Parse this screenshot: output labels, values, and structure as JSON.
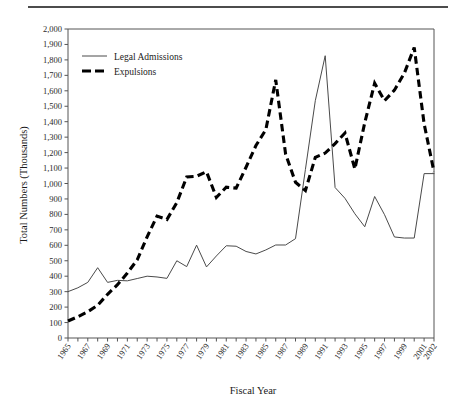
{
  "figure": {
    "rule_present": true
  },
  "chart_data": {
    "type": "line",
    "title": "",
    "xlabel": "Fiscal Year",
    "ylabel": "Total Numbers (Thousands)",
    "xlim": [
      1965,
      2002
    ],
    "ylim": [
      0,
      2000
    ],
    "ytick_step": 100,
    "grid": false,
    "legend_position": "upper-left-inside",
    "xtick_labels": [
      "1965",
      "1967",
      "1969",
      "1971",
      "1973",
      "1975",
      "1977",
      "1979",
      "1981",
      "1983",
      "1985",
      "1987",
      "1989",
      "1991",
      "1993",
      "1995",
      "1997",
      "1999",
      "2001",
      "2002"
    ],
    "ytick_labels": [
      "0",
      "100",
      "200",
      "300",
      "400",
      "500",
      "600",
      "700",
      "800",
      "900",
      "1,000",
      "1,100",
      "1,200",
      "1,300",
      "1,400",
      "1,500",
      "1,600",
      "1,700",
      "1,800",
      "1,900",
      "2,000"
    ],
    "x": [
      1965,
      1966,
      1967,
      1968,
      1969,
      1970,
      1971,
      1972,
      1973,
      1974,
      1975,
      1976,
      1977,
      1978,
      1979,
      1980,
      1981,
      1982,
      1983,
      1984,
      1985,
      1986,
      1987,
      1988,
      1989,
      1990,
      1991,
      1992,
      1993,
      1994,
      1995,
      1996,
      1997,
      1998,
      1999,
      2000,
      2001,
      2002
    ],
    "series": [
      {
        "name": "Legal Admissions",
        "style": "solid-thin",
        "color": "#4a4a4a",
        "values": [
          300,
          325,
          360,
          455,
          360,
          373,
          370,
          385,
          400,
          395,
          386,
          500,
          462,
          601,
          460,
          531,
          597,
          594,
          560,
          544,
          570,
          602,
          602,
          643,
          1091,
          1536,
          1827,
          974,
          904,
          804,
          720,
          916,
          798,
          654,
          647,
          647,
          1064,
          1064
        ]
      },
      {
        "name": "Expulsions",
        "style": "dashed-thick",
        "color": "#000000",
        "values": [
          110,
          138,
          170,
          212,
          283,
          345,
          420,
          506,
          655,
          789,
          767,
          876,
          1042,
          1047,
          1076,
          910,
          976,
          970,
          1105,
          1246,
          1348,
          1671,
          1190,
          1008,
          954,
          1169,
          1197,
          1258,
          1327,
          1094,
          1394,
          1649,
          1536,
          1604,
          1714,
          1880,
          1387,
          1075
        ]
      }
    ],
    "annotations": []
  },
  "legend": {
    "items": [
      {
        "label": "Legal Admissions",
        "marker": "thin-solid-line"
      },
      {
        "label": "Expulsions",
        "marker": "thick-dashed-line"
      }
    ]
  }
}
